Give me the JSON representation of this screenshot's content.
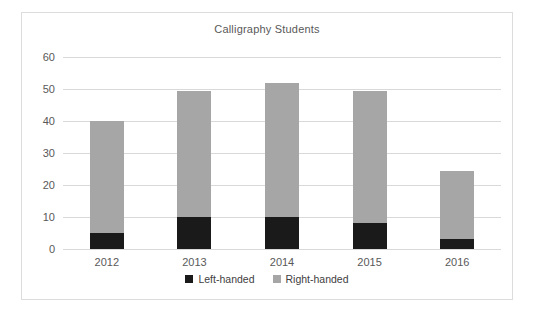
{
  "chart_data": {
    "type": "bar",
    "stacked": true,
    "title": "Calligraphy Students",
    "xlabel": "",
    "ylabel": "",
    "categories": [
      "2012",
      "2013",
      "2014",
      "2015",
      "2016"
    ],
    "series": [
      {
        "name": "Left-handed",
        "color": "#1a1a1a",
        "values": [
          5,
          10,
          10,
          8,
          3
        ]
      },
      {
        "name": "Right-handed",
        "color": "#a6a6a6",
        "values": [
          35,
          39.5,
          42,
          41.5,
          21.5
        ]
      }
    ],
    "totals": [
      40,
      49.5,
      52,
      49.5,
      24.5
    ],
    "ylim": [
      0,
      60
    ],
    "yticks": [
      0,
      10,
      20,
      30,
      40,
      50,
      60
    ],
    "ytick_labels": [
      "0",
      "10",
      "20",
      "30",
      "40",
      "50",
      "60"
    ],
    "grid": true,
    "legend_position": "bottom",
    "legend": [
      "Left-handed",
      "Right-handed"
    ],
    "colors": {
      "left_handed": "#1a1a1a",
      "right_handed": "#a6a6a6",
      "gridline": "#d9d9d9",
      "text": "#595959",
      "frame": "#dcdcdc",
      "background": "#ffffff"
    }
  }
}
